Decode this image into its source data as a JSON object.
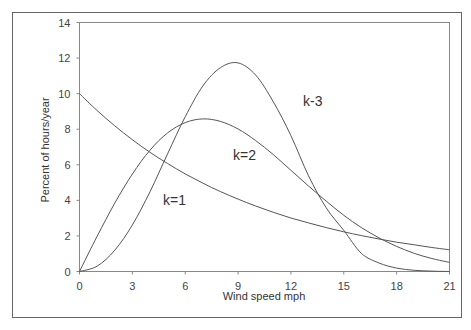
{
  "chart_data": {
    "type": "line",
    "title": "",
    "xlabel": "Wind speed mph",
    "ylabel": "Percent of hours/year",
    "xlim": [
      0,
      21
    ],
    "ylim": [
      0,
      14
    ],
    "x_ticks": [
      0,
      3,
      6,
      9,
      12,
      15,
      18,
      21
    ],
    "y_ticks": [
      0,
      2,
      4,
      6,
      8,
      10,
      12,
      14
    ],
    "grid": false,
    "legend": "none (inline curve labels)",
    "x": [
      0,
      1,
      2,
      3,
      4,
      5,
      6,
      7,
      8,
      9,
      10,
      11,
      12,
      13,
      14,
      15,
      16,
      17,
      18,
      19,
      20,
      21
    ],
    "series": [
      {
        "name": "k=1",
        "label": "k=1",
        "values": [
          10.0,
          9.05,
          8.19,
          7.41,
          6.7,
          6.07,
          5.49,
          4.97,
          4.49,
          4.07,
          3.68,
          3.33,
          3.01,
          2.73,
          2.47,
          2.23,
          2.02,
          1.83,
          1.65,
          1.5,
          1.35,
          1.22
        ]
      },
      {
        "name": "k=2",
        "label": "k=2",
        "values": [
          0.0,
          1.98,
          3.84,
          5.48,
          6.82,
          7.79,
          8.37,
          8.58,
          8.44,
          8.01,
          7.36,
          6.57,
          5.69,
          4.81,
          3.96,
          3.16,
          2.47,
          1.89,
          1.41,
          1.02,
          0.73,
          0.51
        ]
      },
      {
        "name": "k=3",
        "label": "k-3",
        "values": [
          0.0,
          0.3,
          1.19,
          2.62,
          4.48,
          6.62,
          8.7,
          10.43,
          11.46,
          11.73,
          11.04,
          9.54,
          7.64,
          5.38,
          3.58,
          2.31,
          1.02,
          0.48,
          0.19,
          0.07,
          0.02,
          0.0
        ]
      }
    ]
  },
  "labels": {
    "k1": "k=1",
    "k2": "k=2",
    "k3": "k-3"
  },
  "axes": {
    "xlabel": "Wind speed mph",
    "ylabel": "Percent of hours/year"
  },
  "colors": {
    "line": "#555555",
    "frame": "#666666",
    "text": "#333333"
  }
}
